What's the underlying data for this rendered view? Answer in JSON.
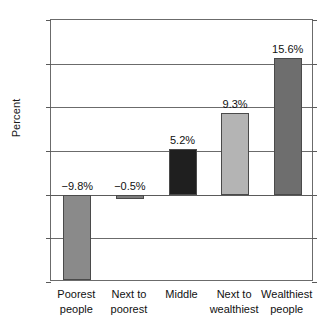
{
  "chart_data": {
    "type": "bar",
    "title": "",
    "xlabel": "",
    "ylabel": "Percent",
    "ylim": [
      -10,
      20
    ],
    "yticks": [
      20,
      15,
      10,
      5,
      0,
      -5,
      -10
    ],
    "ytick_labels": [
      "20",
      "15",
      "10",
      "5",
      "0",
      "−5",
      "−10"
    ],
    "grid": true,
    "legend": "none",
    "categories": [
      "Poorest people",
      "Next to poorest",
      "Middle",
      "Next to wealthiest",
      "Wealthiest people"
    ],
    "category_lines": [
      [
        "Poorest",
        "people"
      ],
      [
        "Next to",
        "poorest"
      ],
      [
        "Middle",
        ""
      ],
      [
        "Next to",
        "wealthiest"
      ],
      [
        "Wealthiest",
        "people"
      ]
    ],
    "values": [
      -9.8,
      -0.5,
      5.2,
      9.3,
      15.6
    ],
    "data_labels": [
      "−9.8%",
      "−0.5%",
      "5.2%",
      "9.3%",
      "15.6%"
    ],
    "bar_colors": [
      "#8a8a8a",
      "#7d7d7d",
      "#1f1f1f",
      "#b4b4b4",
      "#6e6e6e"
    ],
    "bar_edge_color": "#4a4a4a",
    "axis_color": "#6b6b6b",
    "background_color": "#ffffff",
    "text_color": "#111111"
  }
}
